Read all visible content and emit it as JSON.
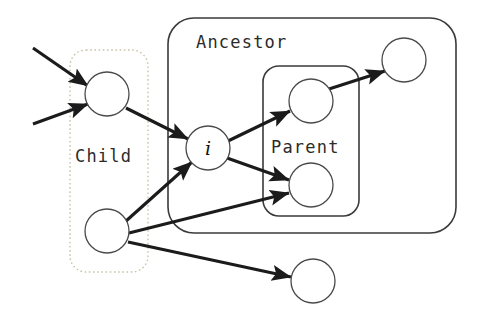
{
  "figure": {
    "type": "node-graph-diagram",
    "width": 481,
    "height": 317,
    "background": "#ffffff"
  },
  "groups": [
    {
      "id": "child",
      "label": "Child",
      "style": "dotted",
      "stroke": "#c9c2a8",
      "label_color": "#2b2b2b",
      "x": 70,
      "y": 50,
      "w": 78,
      "h": 222,
      "r": 16,
      "label_x": 75,
      "label_y": 162
    },
    {
      "id": "ancestor",
      "label": "Ancestor",
      "style": "solid",
      "stroke": "#3a3a38",
      "label_color": "#2b2b2b",
      "x": 168,
      "y": 18,
      "w": 288,
      "h": 215,
      "r": 26,
      "label_x": 196,
      "label_y": 48
    },
    {
      "id": "parent",
      "label": "Parent",
      "style": "solid",
      "stroke": "#3a3a38",
      "label_color": "#2b2b2b",
      "x": 263,
      "y": 66,
      "w": 96,
      "h": 150,
      "r": 16,
      "label_x": 271,
      "label_y": 153
    }
  ],
  "nodes": [
    {
      "id": "child-top",
      "label": "",
      "cx": 107,
      "cy": 94,
      "r": 22,
      "stroke": "#4a4a48",
      "fill": "#ffffff"
    },
    {
      "id": "node-i",
      "label": "i",
      "cx": 208,
      "cy": 148,
      "r": 22,
      "stroke": "#4a4a48",
      "fill": "#ffffff"
    },
    {
      "id": "child-bottom",
      "label": "",
      "cx": 107,
      "cy": 231,
      "r": 22,
      "stroke": "#4a4a48",
      "fill": "#ffffff"
    },
    {
      "id": "parent-top",
      "label": "",
      "cx": 311,
      "cy": 101,
      "r": 22,
      "stroke": "#4a4a48",
      "fill": "#ffffff"
    },
    {
      "id": "parent-bottom",
      "label": "",
      "cx": 311,
      "cy": 185,
      "r": 22,
      "stroke": "#4a4a48",
      "fill": "#ffffff"
    },
    {
      "id": "ancestor-far",
      "label": "",
      "cx": 404,
      "cy": 60,
      "r": 22,
      "stroke": "#4a4a48",
      "fill": "#ffffff"
    },
    {
      "id": "outside-bottom",
      "label": "",
      "cx": 313,
      "cy": 281,
      "r": 22,
      "stroke": "#4a4a48",
      "fill": "#ffffff"
    }
  ],
  "edges": [
    {
      "id": "in-1",
      "from": "external-upper-left",
      "to": "child-top",
      "x1": 33,
      "y1": 48,
      "x2": 88,
      "y2": 86,
      "arrow": true,
      "color": "#1b1b1b"
    },
    {
      "id": "in-2",
      "from": "external-lower-left",
      "to": "child-top",
      "x1": 33,
      "y1": 124,
      "x2": 88,
      "y2": 104,
      "arrow": true,
      "color": "#1b1b1b"
    },
    {
      "id": "e-ct-i",
      "from": "child-top",
      "to": "node-i",
      "x1": 126,
      "y1": 108,
      "x2": 188,
      "y2": 139,
      "arrow": true,
      "color": "#1b1b1b"
    },
    {
      "id": "e-cb-i",
      "from": "child-bottom",
      "to": "node-i",
      "x1": 126,
      "y1": 221,
      "x2": 192,
      "y2": 162,
      "arrow": true,
      "color": "#1b1b1b"
    },
    {
      "id": "e-cb-pb",
      "from": "child-bottom",
      "to": "parent-bottom",
      "x1": 129,
      "y1": 233,
      "x2": 289,
      "y2": 193,
      "arrow": true,
      "color": "#1b1b1b"
    },
    {
      "id": "e-cb-ob",
      "from": "child-bottom",
      "to": "outside-bottom",
      "x1": 128,
      "y1": 242,
      "x2": 291,
      "y2": 277,
      "arrow": true,
      "color": "#1b1b1b"
    },
    {
      "id": "e-i-pt",
      "from": "node-i",
      "to": "parent-top",
      "x1": 228,
      "y1": 141,
      "x2": 290,
      "y2": 111,
      "arrow": true,
      "color": "#1b1b1b"
    },
    {
      "id": "e-i-pb",
      "from": "node-i",
      "to": "parent-bottom",
      "x1": 227,
      "y1": 158,
      "x2": 289,
      "y2": 180,
      "arrow": true,
      "color": "#1b1b1b"
    },
    {
      "id": "e-pt-af",
      "from": "parent-top",
      "to": "ancestor-far",
      "x1": 329,
      "y1": 89,
      "x2": 385,
      "y2": 71,
      "arrow": true,
      "color": "#1b1b1b"
    }
  ]
}
